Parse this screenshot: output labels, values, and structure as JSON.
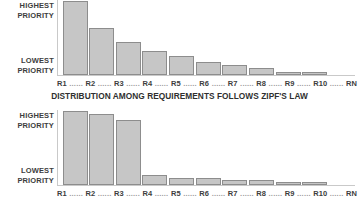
{
  "figure": {
    "caption": "DISTRIBUTION AMONG REQUIREMENTS FOLLOWS ZIPF'S LAW",
    "bar_fill_color": "#c6c6c6",
    "bar_border_color": "#8d8d8d",
    "axis_color": "#c9c9c9",
    "text_color": "#3d3d3d"
  },
  "axis": {
    "y_top_label_line1": "HIGHEST",
    "y_top_label_line2": "PRIORITY",
    "y_bottom_label_line1": "LOWEST",
    "y_bottom_label_line2": "PRIORITY",
    "leader": "......"
  },
  "chart_data": [
    {
      "type": "bar",
      "title": "",
      "subtitle": "",
      "xlabel": "DISTRIBUTION AMONG REQUIREMENTS FOLLOWS ZIPF'S LAW",
      "ylabel": "PRIORITY",
      "grid": false,
      "legend": "none",
      "ylim": [
        0,
        100
      ],
      "ytick_labels": [
        "LOWEST PRIORITY",
        "HIGHEST PRIORITY"
      ],
      "categories": [
        "R1",
        "R2",
        "R3",
        "R4",
        "R5",
        "R6",
        "R7",
        "R8",
        "R9",
        "R10",
        "RN"
      ],
      "values": [
        100,
        63,
        44,
        33,
        26,
        18,
        14,
        9,
        4,
        4,
        0
      ],
      "annotations": [
        "Zipf-like gradual decay across requirements"
      ]
    },
    {
      "type": "bar",
      "title": "",
      "subtitle": "",
      "xlabel": "",
      "ylabel": "PRIORITY",
      "grid": false,
      "legend": "none",
      "ylim": [
        0,
        100
      ],
      "ytick_labels": [
        "LOWEST PRIORITY",
        "HIGHEST PRIORITY"
      ],
      "categories": [
        "R1",
        "R2",
        "R3",
        "R4",
        "R5",
        "R6",
        "R7",
        "R8",
        "R9",
        "R10",
        "RN"
      ],
      "values": [
        100,
        96,
        88,
        13,
        10,
        10,
        7,
        7,
        4,
        4,
        0
      ],
      "annotations": [
        "Three top requirements dominate, then sharp drop"
      ]
    }
  ]
}
